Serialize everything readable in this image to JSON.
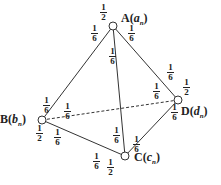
{
  "diagram": {
    "type": "tetrahedron-transition-graph",
    "vertices": [
      {
        "id": "A",
        "label": "A",
        "var": "a",
        "sub": "n",
        "x": 113,
        "y": 26,
        "self_loop": "1/2"
      },
      {
        "id": "B",
        "label": "B",
        "var": "b",
        "sub": "n",
        "x": 42,
        "y": 120,
        "self_loop": "1/2"
      },
      {
        "id": "C",
        "label": "C",
        "var": "c",
        "sub": "n",
        "x": 125,
        "y": 156,
        "self_loop": "1/2"
      },
      {
        "id": "D",
        "label": "D",
        "var": "d",
        "sub": "n",
        "x": 178,
        "y": 100,
        "self_loop": "1/2"
      }
    ],
    "edges": [
      {
        "from": "A",
        "to": "B",
        "style": "solid"
      },
      {
        "from": "A",
        "to": "C",
        "style": "solid"
      },
      {
        "from": "A",
        "to": "D",
        "style": "solid"
      },
      {
        "from": "B",
        "to": "C",
        "style": "solid"
      },
      {
        "from": "C",
        "to": "D",
        "style": "solid"
      },
      {
        "from": "B",
        "to": "D",
        "style": "dashed"
      }
    ],
    "edge_probability": "1/6",
    "fractions": [
      {
        "num": "1",
        "den": "2",
        "x": 100,
        "y": 3,
        "name": "A-self"
      },
      {
        "num": "1",
        "den": "6",
        "x": 91,
        "y": 24,
        "name": "A-to-B"
      },
      {
        "num": "1",
        "den": "6",
        "x": 128,
        "y": 24,
        "name": "A-to-D"
      },
      {
        "num": "1",
        "den": "6",
        "x": 109,
        "y": 47,
        "name": "A-to-C"
      },
      {
        "num": "1",
        "den": "2",
        "x": 36,
        "y": 124,
        "name": "B-self"
      },
      {
        "num": "1",
        "den": "6",
        "x": 43,
        "y": 96,
        "name": "B-to-A"
      },
      {
        "num": "1",
        "den": "6",
        "x": 64,
        "y": 102,
        "name": "B-to-D"
      },
      {
        "num": "1",
        "den": "6",
        "x": 54,
        "y": 128,
        "name": "B-to-C"
      },
      {
        "num": "1",
        "den": "2",
        "x": 107,
        "y": 158,
        "name": "C-self"
      },
      {
        "num": "1",
        "den": "6",
        "x": 93,
        "y": 152,
        "name": "C-to-B"
      },
      {
        "num": "1",
        "den": "6",
        "x": 113,
        "y": 126,
        "name": "C-to-A"
      },
      {
        "num": "1",
        "den": "6",
        "x": 133,
        "y": 135,
        "name": "C-to-D"
      },
      {
        "num": "1",
        "den": "6",
        "x": 167,
        "y": 63,
        "name": "D-to-A"
      },
      {
        "num": "1",
        "den": "6",
        "x": 153,
        "y": 82,
        "name": "D-to-B"
      },
      {
        "num": "1",
        "den": "2",
        "x": 183,
        "y": 78,
        "name": "D-self"
      },
      {
        "num": "1",
        "den": "6",
        "x": 171,
        "y": 103,
        "name": "D-to-C"
      }
    ]
  }
}
